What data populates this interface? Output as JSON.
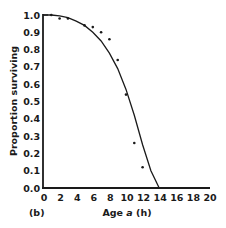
{
  "chart_data": {
    "type": "scatter",
    "panel_label": "(b)",
    "title": "",
    "xlabel": "Age a (h)",
    "xlabel_parts": {
      "prefix": "Age ",
      "symbol": "a",
      "suffix": " (h)"
    },
    "ylabel": "Proportion surviving",
    "xlim": [
      0,
      20
    ],
    "ylim": [
      0,
      1.0
    ],
    "x_ticks": [
      "0",
      "2",
      "4",
      "6",
      "8",
      "10",
      "12",
      "14",
      "16",
      "18",
      "20"
    ],
    "y_ticks": [
      "0.0",
      "0.1",
      "0.2",
      "0.3",
      "0.4",
      "0.5",
      "0.6",
      "0.7",
      "0.8",
      "0.9",
      "1.0"
    ],
    "grid": false,
    "series": [
      {
        "name": "observed",
        "kind": "points",
        "x": [
          1,
          2,
          3,
          5,
          6,
          7,
          8,
          9,
          10,
          11,
          12
        ],
        "y": [
          1.0,
          0.98,
          0.98,
          0.94,
          0.93,
          0.9,
          0.86,
          0.74,
          0.54,
          0.26,
          0.12
        ]
      },
      {
        "name": "fitted curve",
        "kind": "line",
        "x": [
          0,
          1,
          2,
          3,
          4,
          5,
          6,
          7,
          8,
          9,
          10,
          11,
          12,
          13,
          14
        ],
        "y": [
          1.0,
          1.0,
          0.995,
          0.985,
          0.965,
          0.94,
          0.9,
          0.85,
          0.78,
          0.69,
          0.57,
          0.42,
          0.25,
          0.1,
          0.0
        ]
      }
    ]
  }
}
